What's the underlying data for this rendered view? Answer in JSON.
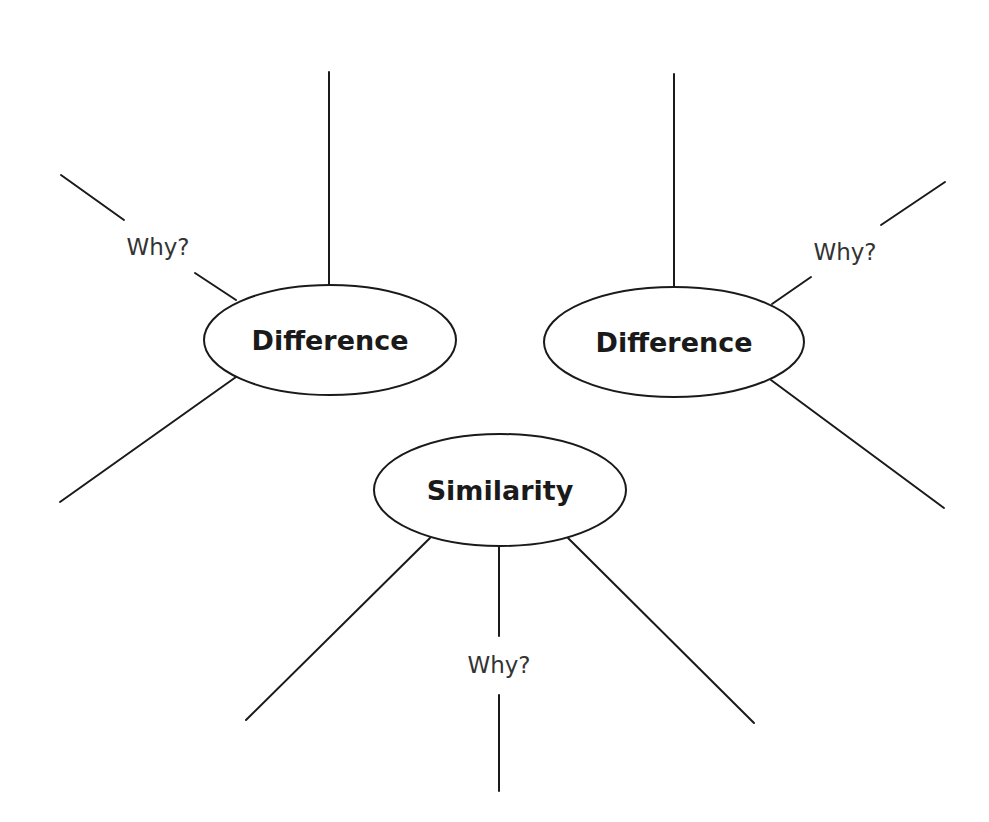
{
  "diagram": {
    "nodes": [
      {
        "id": "difference-left",
        "label": "Difference"
      },
      {
        "id": "difference-right",
        "label": "Difference"
      },
      {
        "id": "similarity",
        "label": "Similarity"
      }
    ],
    "annotations": [
      {
        "attached_to": "difference-left",
        "label": "Why?"
      },
      {
        "attached_to": "difference-right",
        "label": "Why?"
      },
      {
        "attached_to": "similarity",
        "label": "Why?"
      }
    ],
    "colors": {
      "stroke": "#1a1a1a",
      "background": "#ffffff"
    }
  }
}
